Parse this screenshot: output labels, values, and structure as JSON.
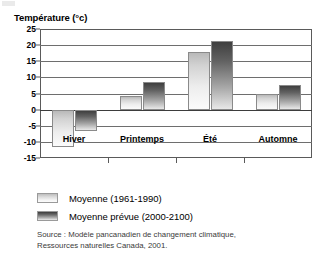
{
  "chart_data": {
    "type": "bar",
    "title": "Température (°c)",
    "xlabel": "",
    "ylabel": "Température (°c)",
    "categories": [
      "Hiver",
      "Printemps",
      "Été",
      "Automne"
    ],
    "series": [
      {
        "name": "Moyenne (1961-1990)",
        "values": [
          -11.5,
          4.3,
          18.0,
          4.8
        ],
        "color": "#d2d2d2"
      },
      {
        "name": "Moyenne prévue (2000-2100)",
        "values": [
          -6.5,
          8.7,
          21.3,
          7.7
        ],
        "color": "#616161"
      }
    ],
    "ylim": [
      -15,
      25
    ],
    "yticks": [
      25,
      20,
      15,
      10,
      5,
      0,
      -5,
      -10,
      -15
    ],
    "ytick_labels": [
      "25",
      "20",
      "15",
      "10",
      "5",
      "0",
      "-5",
      "-10",
      "-15"
    ],
    "grid": true,
    "legend_position": "below"
  },
  "legend": {
    "items": [
      {
        "label": "Moyenne (1961-1990)",
        "swatch": "light"
      },
      {
        "label": "Moyenne prévue (2000-2100)",
        "swatch": "dark"
      }
    ]
  },
  "source": {
    "line1": "Source : Modèle pancanadien de changement climatique,",
    "line2": "Ressources naturelles Canada, 2001."
  }
}
